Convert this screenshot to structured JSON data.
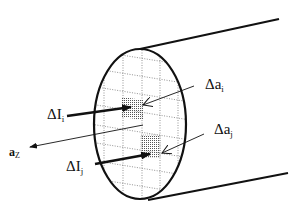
{
  "diagram": {
    "labels": {
      "delta_i_i": {
        "main": "ΔI",
        "sub": "i"
      },
      "delta_i_j": {
        "main": "ΔI",
        "sub": "j"
      },
      "delta_a_i": {
        "main": "Δa",
        "sub": "i"
      },
      "delta_a_j": {
        "main": "Δa",
        "sub": "j"
      },
      "a_z": {
        "main": "a",
        "sub": "Z"
      }
    },
    "colors": {
      "stroke": "#111111",
      "grid": "#666666",
      "background": "#ffffff"
    }
  }
}
